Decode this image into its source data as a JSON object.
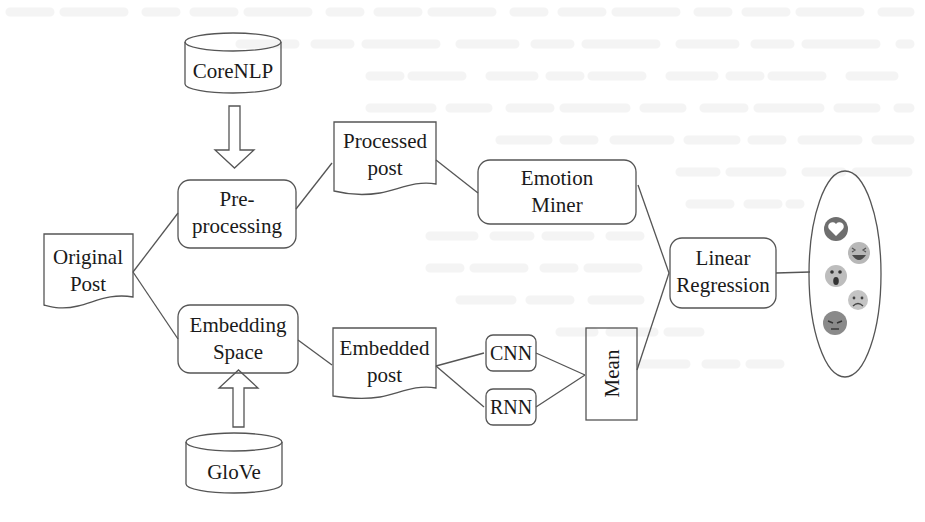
{
  "diagram": {
    "type": "flowchart",
    "direction": "left-to-right",
    "nodes": {
      "corenlp": {
        "label": "CoreNLP",
        "shape": "cylinder"
      },
      "glove": {
        "label": "GloVe",
        "shape": "cylinder"
      },
      "original_post": {
        "label_line1": "Original",
        "label_line2": "Post",
        "shape": "document"
      },
      "preprocessing": {
        "label_line1": "Pre-",
        "label_line2": "processing",
        "shape": "rounded-rect"
      },
      "embedding_space": {
        "label_line1": "Embedding",
        "label_line2": "Space",
        "shape": "rounded-rect"
      },
      "processed_post": {
        "label_line1": "Processed",
        "label_line2": "post",
        "shape": "document"
      },
      "embedded_post": {
        "label_line1": "Embedded",
        "label_line2": "post",
        "shape": "document"
      },
      "emotion_miner": {
        "label_line1": "Emotion",
        "label_line2": "Miner",
        "shape": "rounded-rect"
      },
      "cnn": {
        "label": "CNN",
        "shape": "rounded-rect"
      },
      "rnn": {
        "label": "RNN",
        "shape": "rounded-rect"
      },
      "mean": {
        "label": "Mean",
        "shape": "rect",
        "text_rotation": "-90deg"
      },
      "linear_regression": {
        "label_line1": "Linear",
        "label_line2": "Regression",
        "shape": "rounded-rect"
      },
      "reactions": {
        "shape": "ellipse",
        "icons": [
          "love-reaction",
          "haha-reaction",
          "wow-reaction",
          "sad-reaction",
          "angry-reaction"
        ]
      }
    },
    "edges": [
      {
        "from": "CoreNLP",
        "to": "Pre-processing",
        "style": "block-arrow"
      },
      {
        "from": "GloVe",
        "to": "Embedding Space",
        "style": "block-arrow"
      },
      {
        "from": "Original Post",
        "to": "Pre-processing",
        "style": "line"
      },
      {
        "from": "Original Post",
        "to": "Embedding Space",
        "style": "line"
      },
      {
        "from": "Pre-processing",
        "to": "Processed post",
        "style": "line"
      },
      {
        "from": "Processed post",
        "to": "Emotion Miner",
        "style": "line"
      },
      {
        "from": "Embedding Space",
        "to": "Embedded post",
        "style": "line"
      },
      {
        "from": "Embedded post",
        "to": "CNN",
        "style": "line"
      },
      {
        "from": "Embedded post",
        "to": "RNN",
        "style": "line"
      },
      {
        "from": "CNN",
        "to": "Mean",
        "style": "line"
      },
      {
        "from": "RNN",
        "to": "Mean",
        "style": "line"
      },
      {
        "from": "Emotion Miner",
        "to": "Linear Regression",
        "style": "line"
      },
      {
        "from": "Mean",
        "to": "Linear Regression",
        "style": "line"
      },
      {
        "from": "Linear Regression",
        "to": "Reactions",
        "style": "line"
      }
    ],
    "colors": {
      "stroke": "#555555",
      "text": "#1a1a1a",
      "emoji_dark": "#6e6e6e",
      "emoji_light": "#b8b8b8"
    }
  }
}
